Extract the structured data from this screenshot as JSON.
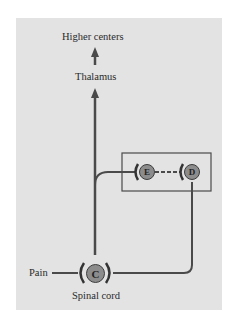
{
  "labels": {
    "higher_centers": "Higher centers",
    "thalamus": "Thalamus",
    "pain": "Pain",
    "spinal_cord": "Spinal cord"
  },
  "nodes": {
    "c": "C",
    "e": "E",
    "d": "D"
  },
  "colors": {
    "panel": "#e3e3e3",
    "line": "#4a4a4a",
    "node_fill": "#8c8c8c"
  }
}
